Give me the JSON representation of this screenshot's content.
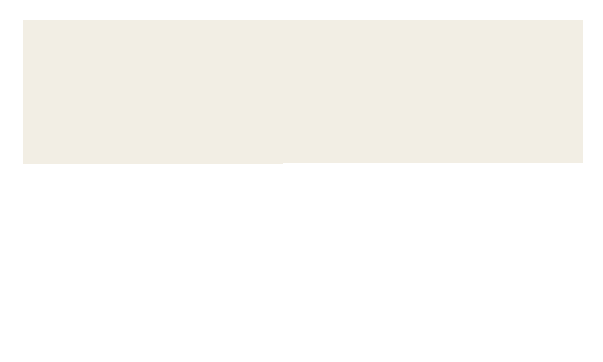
{
  "labels": {
    "cytosol": "Cytosol",
    "mitochondrion": "MITOCHONDRION"
  },
  "stages": {
    "glycolysis": {
      "title": "Glycolysis",
      "input": "Glucose",
      "output_count": "2",
      "output": "Pyruvate"
    },
    "pyruvate_oxidation": {
      "title_line1": "Pyruvate",
      "title_line2": "Oxidation",
      "output_line1": "2 Acetyl",
      "output_line2": "CoA"
    },
    "citric_acid_cycle": {
      "title_line1": "Citric Acid",
      "title_line2": "Cycle"
    },
    "oxidative_phosphorylation": {
      "title_line1": "Oxidative",
      "title_line2": "Phosphorylation",
      "sub_line1": "(electron transport",
      "sub_line2": "and chemiosmosis)"
    }
  },
  "carriers": [
    {
      "count": "2",
      "name": "NADH"
    },
    {
      "count": "2",
      "name": "NADH"
    },
    {
      "count": "6",
      "name": "NADH"
    },
    {
      "plus": "+ 2",
      "name": "FADH",
      "subscript": "2"
    }
  ],
  "molecules": {
    "co2": {
      "base": "CO",
      "sub": "2"
    },
    "o2": {
      "base": "O",
      "sub": "2"
    },
    "h2o": {
      "pre": "H",
      "sub": "2",
      "post": "O"
    }
  },
  "atp_yields": [
    {
      "line1": "+ 2",
      "line2": "ATP",
      "caption1": "by substrate-level",
      "caption2": "phosphorylation"
    },
    {
      "line1": "+ 2",
      "line2": "ATP",
      "caption1": "by substrate-level",
      "caption2": "phosphorylation"
    },
    {
      "line1": "+ about",
      "line2": "28 ATP",
      "caption1": "by oxidative",
      "caption2": "phosphorylation"
    }
  ],
  "total": {
    "heading1": "Maximum",
    "heading2": "per glucose:",
    "line1": "About",
    "line2": "32 ATP"
  },
  "colors": {
    "background_panel": "#f2eee4",
    "mitochondrion": "#e3cfc0",
    "glycolysis_box": "#cf8450",
    "pyruvate_box": "#cf8450",
    "citric_cycle": "#cc5f4a",
    "oxphos_box": "#855496",
    "flow_arrow": "#dfdfa6",
    "atp_star": "#f2e9ae"
  }
}
